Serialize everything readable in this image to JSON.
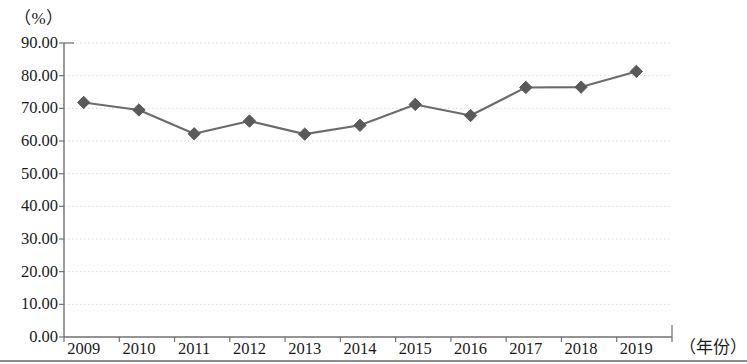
{
  "chart_data": {
    "type": "line",
    "title": "",
    "subtitle": "",
    "xlabel": "（年份）",
    "ylabel": "（%）",
    "categories": [
      "2009",
      "2010",
      "2011",
      "2012",
      "2013",
      "2014",
      "2015",
      "2016",
      "2017",
      "2018",
      "2019"
    ],
    "values": [
      71.8,
      69.5,
      62.2,
      66.1,
      62.1,
      64.8,
      71.2,
      67.8,
      76.4,
      76.5,
      81.3
    ],
    "series": [
      {
        "name": "",
        "values": [
          71.8,
          69.5,
          62.2,
          66.1,
          62.1,
          64.8,
          71.2,
          67.8,
          76.4,
          76.5,
          81.3
        ]
      }
    ],
    "ylim": [
      0.0,
      90.0
    ],
    "ytick_labels": [
      "90.00",
      "80.00",
      "70.00",
      "60.00",
      "50.00",
      "40.00",
      "30.00",
      "20.00",
      "10.00",
      "0.00"
    ],
    "ytick_values": [
      90,
      80,
      70,
      60,
      50,
      40,
      30,
      20,
      10,
      0
    ],
    "xtick_labels": [
      "2009",
      "2010",
      "2011",
      "2012",
      "2013",
      "2014",
      "2015",
      "2016",
      "2017",
      "2018",
      "2019"
    ],
    "grid": "horizontal-dotted",
    "legend": "none",
    "marker": "diamond",
    "line_color": "#6b6b6b",
    "marker_color": "#5a5a5a",
    "grid_color": "#d9d9d9",
    "axis_color": "#707070"
  },
  "axes": {
    "y_unit_caption": "（%）",
    "x_unit_caption": "（年份）"
  }
}
